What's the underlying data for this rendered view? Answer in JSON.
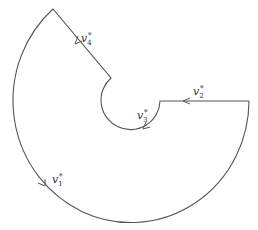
{
  "diagram": {
    "type": "contour",
    "stroke_color": "#555555",
    "segments": [
      {
        "id": "v1",
        "label_base": "v",
        "label_sub": "1",
        "label_sup": "*",
        "kind": "outer-arc"
      },
      {
        "id": "v2",
        "label_base": "v",
        "label_sub": "2",
        "label_sup": "*",
        "kind": "horizontal-segment"
      },
      {
        "id": "v3",
        "label_base": "v",
        "label_sub": "3",
        "label_sup": "*",
        "kind": "inner-arc"
      },
      {
        "id": "v4",
        "label_base": "v",
        "label_sub": "4",
        "label_sup": "*",
        "kind": "slanted-segment"
      }
    ]
  }
}
